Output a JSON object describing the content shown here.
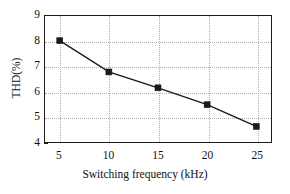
{
  "chart_data": {
    "type": "line",
    "title": "",
    "xlabel": "Switching frequency (kHz)",
    "ylabel": "THD(%)",
    "xlim": [
      3.5,
      26.5
    ],
    "ylim": [
      4,
      9
    ],
    "xticks": [
      5,
      10,
      15,
      20,
      25
    ],
    "xticklabels": [
      "5",
      "10",
      "15",
      "20",
      "25"
    ],
    "yticks": [
      4,
      5,
      6,
      7,
      8,
      9
    ],
    "yticklabels": [
      "4",
      "5",
      "6",
      "7",
      "8",
      "9"
    ],
    "grid": true,
    "grid_style": "dotted",
    "grid_color": "#aeaeae",
    "legend": null,
    "marker": "filled-square",
    "line_color": "#1a1a1a",
    "marker_color": "#1a1a1a",
    "x": [
      5,
      10,
      15,
      20,
      25
    ],
    "values": [
      8.02,
      6.78,
      6.15,
      5.48,
      4.62
    ],
    "series": [
      {
        "name": "THD",
        "x": [
          5,
          10,
          15,
          20,
          25
        ],
        "values": [
          8.02,
          6.78,
          6.15,
          5.48,
          4.62
        ]
      }
    ]
  }
}
